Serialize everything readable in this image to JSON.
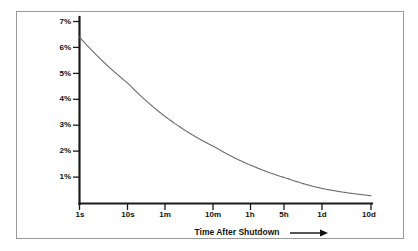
{
  "chart_data": {
    "type": "line",
    "title": "",
    "subtitle": "",
    "xlabel": "Time After Shutdown",
    "xlabel_arrow": "⟶",
    "ylabel": "",
    "xscale": "log",
    "yscale": "linear",
    "grid": false,
    "legend": false,
    "legend_position": "none",
    "ylim": [
      0,
      7
    ],
    "ytick_labels": [
      "1%",
      "2%",
      "3%",
      "4%",
      "5%",
      "6%",
      "7%"
    ],
    "ytick_values": [
      1,
      2,
      3,
      4,
      5,
      6,
      7
    ],
    "xtick_labels": [
      "1s",
      "10s",
      "1m",
      "10m",
      "1h",
      "5h",
      "1d",
      "10d"
    ],
    "xtick_seconds": [
      1,
      10,
      60,
      600,
      3600,
      18000,
      86400,
      864000
    ],
    "series": [
      {
        "name": "Decay Heat",
        "color": "#6b6b6b",
        "x_labels": [
          "1s",
          "10s",
          "1m",
          "10m",
          "1h",
          "5h",
          "1d",
          "10d"
        ],
        "x": [
          1,
          10,
          60,
          600,
          3600,
          18000,
          86400,
          864000
        ],
        "values": [
          6.4,
          4.6,
          3.3,
          2.15,
          1.42,
          0.95,
          0.58,
          0.3
        ]
      }
    ],
    "annotations": []
  },
  "figure": {
    "background_color": "#ffffff",
    "frame_color": "#9a9a9a",
    "axis_color": "#1a1a1a",
    "curve_color": "#6b6b6b"
  }
}
